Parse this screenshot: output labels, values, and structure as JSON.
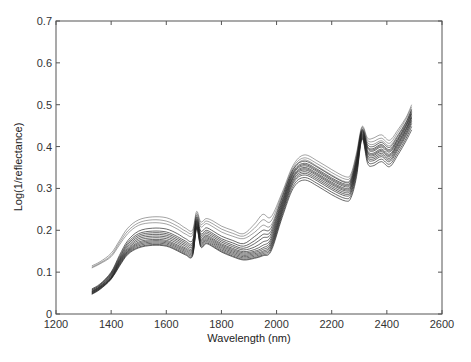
{
  "chart_data": {
    "type": "line",
    "title": "",
    "xlabel": "Wavelength (nm)",
    "ylabel": "Log(1/reflectance)",
    "xlim": [
      1200,
      2600
    ],
    "ylim": [
      0,
      0.7
    ],
    "xticks": [
      1200,
      1400,
      1600,
      1800,
      2000,
      2200,
      2400,
      2600
    ],
    "yticks": [
      0,
      0.1,
      0.2,
      0.3,
      0.4,
      0.5,
      0.6,
      0.7
    ],
    "xtick_labels": [
      "1200",
      "1400",
      "1600",
      "1800",
      "2000",
      "2200",
      "2400",
      "2600"
    ],
    "ytick_labels": [
      "0",
      "0.1",
      "0.2",
      "0.3",
      "0.4",
      "0.5",
      "0.6",
      "0.7"
    ],
    "grid": false,
    "legend": null,
    "line_color": "#222222",
    "x": [
      1330,
      1360,
      1400,
      1430,
      1460,
      1500,
      1550,
      1600,
      1640,
      1670,
      1695,
      1710,
      1725,
      1745,
      1770,
      1800,
      1840,
      1880,
      1920,
      1950,
      1980,
      2020,
      2060,
      2100,
      2150,
      2200,
      2250,
      2270,
      2290,
      2310,
      2330,
      2350,
      2380,
      2410,
      2440,
      2470,
      2490
    ],
    "series": [
      {
        "name": "spectrum 1",
        "values": [
          0.115,
          0.125,
          0.145,
          0.175,
          0.205,
          0.225,
          0.232,
          0.23,
          0.218,
          0.205,
          0.2,
          0.245,
          0.22,
          0.228,
          0.222,
          0.21,
          0.2,
          0.192,
          0.215,
          0.238,
          0.232,
          0.29,
          0.355,
          0.38,
          0.365,
          0.345,
          0.328,
          0.335,
          0.385,
          0.448,
          0.42,
          0.42,
          0.428,
          0.415,
          0.44,
          0.47,
          0.5
        ]
      },
      {
        "name": "spectrum 2",
        "values": [
          0.112,
          0.122,
          0.14,
          0.17,
          0.198,
          0.218,
          0.225,
          0.222,
          0.21,
          0.198,
          0.194,
          0.24,
          0.214,
          0.222,
          0.215,
          0.203,
          0.193,
          0.186,
          0.205,
          0.225,
          0.222,
          0.285,
          0.35,
          0.373,
          0.358,
          0.338,
          0.322,
          0.33,
          0.38,
          0.445,
          0.415,
          0.412,
          0.42,
          0.408,
          0.434,
          0.466,
          0.495
        ]
      },
      {
        "name": "spectrum 3",
        "values": [
          0.11,
          0.12,
          0.137,
          0.165,
          0.192,
          0.212,
          0.218,
          0.215,
          0.203,
          0.191,
          0.188,
          0.236,
          0.208,
          0.216,
          0.208,
          0.196,
          0.186,
          0.18,
          0.195,
          0.212,
          0.212,
          0.28,
          0.345,
          0.368,
          0.352,
          0.332,
          0.316,
          0.325,
          0.376,
          0.442,
          0.41,
          0.405,
          0.414,
          0.402,
          0.428,
          0.46,
          0.49
        ]
      },
      {
        "name": "spectrum 4",
        "values": [
          0.06,
          0.072,
          0.1,
          0.14,
          0.175,
          0.198,
          0.205,
          0.203,
          0.192,
          0.18,
          0.176,
          0.232,
          0.198,
          0.206,
          0.198,
          0.186,
          0.176,
          0.168,
          0.185,
          0.2,
          0.205,
          0.278,
          0.345,
          0.365,
          0.35,
          0.33,
          0.314,
          0.322,
          0.372,
          0.44,
          0.405,
          0.4,
          0.41,
          0.398,
          0.425,
          0.458,
          0.488
        ]
      },
      {
        "name": "spectrum 5",
        "values": [
          0.058,
          0.07,
          0.098,
          0.136,
          0.17,
          0.192,
          0.198,
          0.196,
          0.185,
          0.174,
          0.17,
          0.228,
          0.192,
          0.2,
          0.192,
          0.18,
          0.17,
          0.162,
          0.175,
          0.19,
          0.198,
          0.272,
          0.34,
          0.36,
          0.345,
          0.325,
          0.31,
          0.318,
          0.368,
          0.438,
          0.4,
          0.395,
          0.405,
          0.393,
          0.42,
          0.454,
          0.484
        ]
      },
      {
        "name": "spectrum 6",
        "values": [
          0.057,
          0.069,
          0.096,
          0.133,
          0.166,
          0.188,
          0.194,
          0.192,
          0.181,
          0.17,
          0.166,
          0.225,
          0.188,
          0.196,
          0.188,
          0.176,
          0.165,
          0.157,
          0.168,
          0.182,
          0.192,
          0.268,
          0.337,
          0.357,
          0.342,
          0.322,
          0.307,
          0.315,
          0.365,
          0.436,
          0.398,
          0.392,
          0.402,
          0.39,
          0.417,
          0.451,
          0.481
        ]
      },
      {
        "name": "spectrum 7",
        "values": [
          0.055,
          0.067,
          0.094,
          0.13,
          0.162,
          0.184,
          0.19,
          0.188,
          0.177,
          0.166,
          0.162,
          0.222,
          0.184,
          0.192,
          0.184,
          0.172,
          0.161,
          0.153,
          0.16,
          0.172,
          0.186,
          0.264,
          0.334,
          0.354,
          0.339,
          0.319,
          0.304,
          0.312,
          0.362,
          0.434,
          0.395,
          0.389,
          0.399,
          0.387,
          0.414,
          0.448,
          0.478
        ]
      },
      {
        "name": "spectrum 8",
        "values": [
          0.054,
          0.066,
          0.092,
          0.128,
          0.158,
          0.18,
          0.186,
          0.184,
          0.173,
          0.162,
          0.158,
          0.22,
          0.18,
          0.188,
          0.18,
          0.168,
          0.157,
          0.149,
          0.154,
          0.164,
          0.18,
          0.26,
          0.33,
          0.35,
          0.335,
          0.315,
          0.3,
          0.308,
          0.358,
          0.432,
          0.39,
          0.384,
          0.394,
          0.382,
          0.41,
          0.444,
          0.474
        ]
      },
      {
        "name": "spectrum 9",
        "values": [
          0.053,
          0.065,
          0.09,
          0.126,
          0.155,
          0.176,
          0.182,
          0.18,
          0.169,
          0.158,
          0.155,
          0.217,
          0.177,
          0.185,
          0.177,
          0.165,
          0.154,
          0.146,
          0.15,
          0.158,
          0.175,
          0.256,
          0.327,
          0.347,
          0.332,
          0.312,
          0.297,
          0.305,
          0.355,
          0.43,
          0.387,
          0.381,
          0.391,
          0.379,
          0.407,
          0.441,
          0.471
        ]
      },
      {
        "name": "spectrum 10",
        "values": [
          0.052,
          0.064,
          0.088,
          0.124,
          0.152,
          0.172,
          0.178,
          0.176,
          0.165,
          0.155,
          0.152,
          0.215,
          0.174,
          0.182,
          0.174,
          0.162,
          0.151,
          0.143,
          0.147,
          0.154,
          0.17,
          0.252,
          0.324,
          0.344,
          0.329,
          0.309,
          0.294,
          0.302,
          0.352,
          0.428,
          0.384,
          0.378,
          0.388,
          0.376,
          0.404,
          0.438,
          0.468
        ]
      },
      {
        "name": "spectrum 11",
        "values": [
          0.051,
          0.063,
          0.087,
          0.122,
          0.15,
          0.169,
          0.175,
          0.173,
          0.162,
          0.152,
          0.149,
          0.212,
          0.171,
          0.179,
          0.171,
          0.159,
          0.148,
          0.14,
          0.144,
          0.15,
          0.166,
          0.248,
          0.32,
          0.34,
          0.325,
          0.305,
          0.29,
          0.298,
          0.348,
          0.426,
          0.38,
          0.374,
          0.384,
          0.372,
          0.4,
          0.434,
          0.464
        ]
      },
      {
        "name": "spectrum 12",
        "values": [
          0.05,
          0.062,
          0.086,
          0.12,
          0.148,
          0.166,
          0.172,
          0.17,
          0.159,
          0.149,
          0.146,
          0.21,
          0.168,
          0.176,
          0.168,
          0.156,
          0.145,
          0.137,
          0.141,
          0.147,
          0.162,
          0.244,
          0.316,
          0.336,
          0.321,
          0.301,
          0.286,
          0.294,
          0.344,
          0.424,
          0.376,
          0.37,
          0.38,
          0.368,
          0.396,
          0.43,
          0.46
        ]
      },
      {
        "name": "spectrum 13",
        "values": [
          0.049,
          0.061,
          0.085,
          0.118,
          0.146,
          0.163,
          0.169,
          0.167,
          0.156,
          0.146,
          0.143,
          0.208,
          0.165,
          0.173,
          0.165,
          0.153,
          0.142,
          0.134,
          0.138,
          0.144,
          0.158,
          0.24,
          0.312,
          0.332,
          0.317,
          0.297,
          0.282,
          0.29,
          0.34,
          0.422,
          0.372,
          0.366,
          0.376,
          0.364,
          0.392,
          0.426,
          0.455
        ]
      },
      {
        "name": "spectrum 14",
        "values": [
          0.048,
          0.06,
          0.084,
          0.116,
          0.144,
          0.16,
          0.166,
          0.164,
          0.153,
          0.143,
          0.14,
          0.206,
          0.162,
          0.17,
          0.162,
          0.15,
          0.139,
          0.131,
          0.135,
          0.141,
          0.154,
          0.235,
          0.306,
          0.326,
          0.311,
          0.291,
          0.276,
          0.284,
          0.334,
          0.42,
          0.366,
          0.36,
          0.37,
          0.358,
          0.386,
          0.42,
          0.448
        ]
      },
      {
        "name": "spectrum 15",
        "values": [
          0.047,
          0.059,
          0.083,
          0.114,
          0.142,
          0.158,
          0.164,
          0.162,
          0.151,
          0.141,
          0.138,
          0.204,
          0.16,
          0.168,
          0.16,
          0.148,
          0.137,
          0.129,
          0.133,
          0.139,
          0.15,
          0.23,
          0.3,
          0.32,
          0.305,
          0.285,
          0.27,
          0.278,
          0.328,
          0.418,
          0.36,
          0.354,
          0.364,
          0.352,
          0.38,
          0.414,
          0.44
        ]
      }
    ]
  },
  "caption": {
    "text": ""
  }
}
